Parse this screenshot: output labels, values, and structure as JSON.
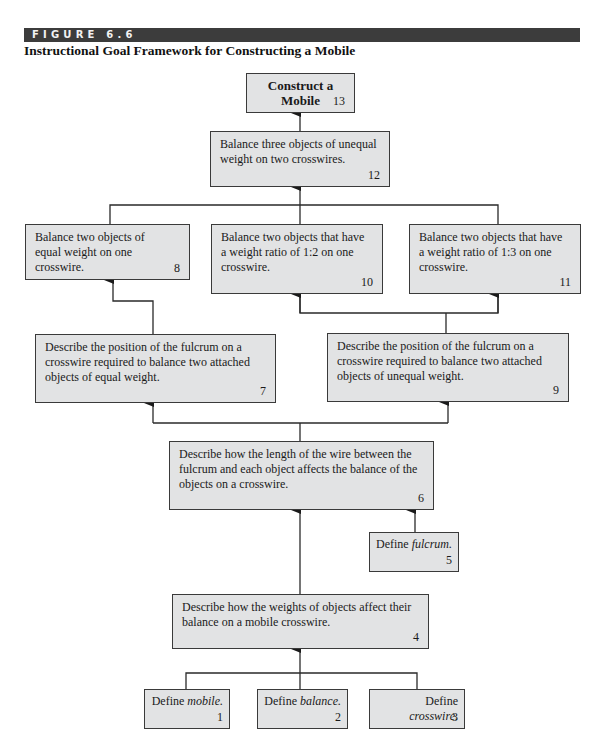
{
  "figure": {
    "label": "FIGURE 6.6",
    "title": "Instructional Goal Framework for Constructing a Mobile",
    "bar_color": "#3c3c3c",
    "box_fill": "#e2e3e4",
    "line_color": "#2a2a2a"
  },
  "nodes": {
    "n13": {
      "text": "Construct a Mobile",
      "number": "13"
    },
    "n12": {
      "text": "Balance three objects of unequal weight on two crosswires.",
      "number": "12"
    },
    "n8": {
      "text": "Balance two objects of equal weight on one crosswire.",
      "number": "8"
    },
    "n10": {
      "text": "Balance two objects that have a weight ratio of 1:2 on one crosswire.",
      "number": "10"
    },
    "n11": {
      "text": "Balance two objects that have a weight ratio of 1:3 on one crosswire.",
      "number": "11"
    },
    "n7": {
      "text": "Describe the position of the fulcrum on a crosswire required to balance two attached objects of equal weight.",
      "number": "7"
    },
    "n9": {
      "text": "Describe the position of the fulcrum on a crosswire required to balance two attached objects of unequal weight.",
      "number": "9"
    },
    "n6": {
      "text": "Describe how the length of the wire between the fulcrum and each object affects the balance of the objects on a crosswire.",
      "number": "6"
    },
    "n5": {
      "prefix": "Define ",
      "term": "fulcrum.",
      "number": "5"
    },
    "n4": {
      "text": "Describe how the weights of objects affect their balance on a mobile crosswire.",
      "number": "4"
    },
    "n1": {
      "prefix": "Define ",
      "term": "mobile.",
      "number": "1"
    },
    "n2": {
      "prefix": "Define ",
      "term": "balance.",
      "number": "2"
    },
    "n3": {
      "prefix": "Define ",
      "term": "crosswire.",
      "number": "3"
    }
  },
  "edges": [
    {
      "from": "12",
      "to": "13"
    },
    {
      "from": "8",
      "to": "12"
    },
    {
      "from": "10",
      "to": "12"
    },
    {
      "from": "11",
      "to": "12"
    },
    {
      "from": "7",
      "to": "8"
    },
    {
      "from": "9",
      "to": "10"
    },
    {
      "from": "9",
      "to": "11"
    },
    {
      "from": "6",
      "to": "7"
    },
    {
      "from": "6",
      "to": "9"
    },
    {
      "from": "4",
      "to": "6"
    },
    {
      "from": "5",
      "to": "6"
    },
    {
      "from": "1",
      "to": "4"
    },
    {
      "from": "2",
      "to": "4"
    },
    {
      "from": "3",
      "to": "4"
    }
  ]
}
